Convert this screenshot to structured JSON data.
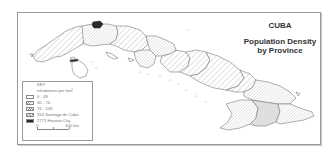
{
  "title": {
    "country": "CUBA",
    "subtitle_line1": "Population Density",
    "subtitle_line2": "by Province"
  },
  "legend": {
    "heading": "KEY",
    "unit": "inhabitants per km²",
    "items": [
      {
        "label": "0 - 48",
        "pattern": "blank"
      },
      {
        "label": "50 - 74",
        "pattern": "wide-hatch"
      },
      {
        "label": "75 - 109",
        "pattern": "dense-hatch"
      },
      {
        "label": "153 Santiago de Cuba",
        "pattern": "stipple"
      },
      {
        "label": "2771 Havana City",
        "pattern": "solid-black"
      }
    ],
    "scale": {
      "start": "0",
      "end": "100 km"
    }
  },
  "map": {
    "subject": "Cuba provinces",
    "colors": {
      "outline": "#777777",
      "hatch": "#9a9a9a",
      "havana_city": "#2a2a2a",
      "frame": "#9a9a9a"
    },
    "regions": [
      {
        "name": "Pinar del Río",
        "class": "50 - 74"
      },
      {
        "name": "Havana",
        "class": "75 - 109"
      },
      {
        "name": "Havana City",
        "class": "2771"
      },
      {
        "name": "Isle of Youth",
        "class": "0 - 48"
      },
      {
        "name": "Matanzas",
        "class": "50 - 74"
      },
      {
        "name": "Cienfuegos",
        "class": "75 - 109"
      },
      {
        "name": "Villa Clara",
        "class": "75 - 109"
      },
      {
        "name": "Sancti Spíritus",
        "class": "50 - 74"
      },
      {
        "name": "Ciego de Ávila",
        "class": "50 - 74"
      },
      {
        "name": "Camagüey",
        "class": "0 - 48"
      },
      {
        "name": "Las Tunas",
        "class": "50 - 74"
      },
      {
        "name": "Holguín",
        "class": "75 - 109"
      },
      {
        "name": "Granma",
        "class": "75 - 109"
      },
      {
        "name": "Santiago de Cuba",
        "class": "153"
      },
      {
        "name": "Guantánamo",
        "class": "75 - 109"
      }
    ]
  }
}
